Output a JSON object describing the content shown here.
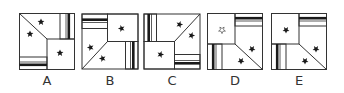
{
  "puzzle": {
    "options": [
      {
        "label": "A",
        "rotation": 0,
        "plain_star": "solid"
      },
      {
        "label": "B",
        "rotation": -90,
        "plain_star": "solid"
      },
      {
        "label": "C",
        "rotation": 90,
        "plain_star": "solid"
      },
      {
        "label": "D",
        "rotation": 180,
        "plain_star": "hollow"
      },
      {
        "label": "E",
        "rotation": 180,
        "plain_star": "solid"
      }
    ]
  },
  "colors": {
    "stroke": "#333333",
    "fill": "#ffffff",
    "ink": "#1a1a1a"
  }
}
